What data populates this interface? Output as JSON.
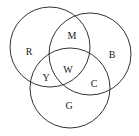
{
  "diagram": {
    "type": "venn",
    "circles": [
      {
        "id": "red",
        "cx": 50,
        "cy": 47,
        "r": 40
      },
      {
        "id": "blue",
        "cx": 90,
        "cy": 54,
        "r": 41
      },
      {
        "id": "green",
        "cx": 70,
        "cy": 88,
        "r": 40
      }
    ],
    "stroke_color": "#333333",
    "labels": [
      {
        "text": "R",
        "x": 29,
        "y": 52
      },
      {
        "text": "M",
        "x": 72,
        "y": 36
      },
      {
        "text": "B",
        "x": 112,
        "y": 55
      },
      {
        "text": "Y",
        "x": 46,
        "y": 78
      },
      {
        "text": "W",
        "x": 68,
        "y": 70
      },
      {
        "text": "C",
        "x": 94,
        "y": 84
      },
      {
        "text": "G",
        "x": 69,
        "y": 106
      }
    ]
  }
}
